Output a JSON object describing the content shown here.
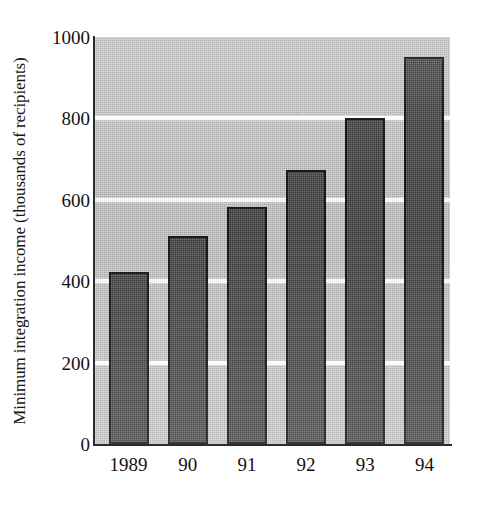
{
  "chart_data": {
    "type": "bar",
    "title": "",
    "xlabel": "",
    "ylabel": "Minimum integration income (thousands of recipients)",
    "categories": [
      "1989",
      "90",
      "91",
      "92",
      "93",
      "94"
    ],
    "values": [
      423,
      511,
      582,
      673,
      800,
      951
    ],
    "series": [
      {
        "name": "Minimum integration income",
        "values": [
          423,
          511,
          582,
          673,
          800,
          951
        ]
      }
    ],
    "ylim": [
      0,
      1000
    ],
    "yticks": [
      0,
      200,
      400,
      600,
      800,
      1000
    ],
    "ytick_labels": [
      "0",
      "200",
      "400",
      "600",
      "800",
      "1000"
    ],
    "grid": true,
    "gridlines_at": [
      200,
      400,
      600,
      800
    ],
    "legend": "none",
    "legend_position": "none",
    "colors": {
      "bar_fill": "#4e4e4e",
      "bar_edge": "#1b1b1b",
      "plot_background": "#c2c2c2",
      "gridline": "#fbfbfb",
      "axis": "#2b2b2b",
      "text": "#131313",
      "page_background": "#ffffff"
    }
  }
}
